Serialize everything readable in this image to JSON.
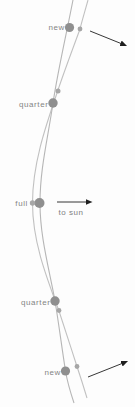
{
  "diagram": {
    "colors": {
      "background": "#fdfdfd",
      "earth_path_stroke": "#b6b6b6",
      "moon_path_stroke": "#c1c1c1",
      "earth_body_fill": "#8f8f8f",
      "moon_body_fill": "#a6a6a6",
      "arrow_stroke": "#1f1f1f",
      "label_text": "#848484"
    },
    "earth_path": "M 73 0 C 66 36 58 70 53 103 C 48 138 40 168 40 203 C 40 237 49 268 55 301 C 59 325 62 349 65.5 371 C 67.5 383 71 394 74 403",
    "moon_path": "M 88 0 C 85 11 82.5 19 80 29 C 72 51 64 72 57 93 C 45 128 32.5 165 32.5 203 C 32.5 241 46 276 59 311 C 65 329 71 348 77 366.5 C 80.5 377 84 388 87 398",
    "phase_labels": [
      {
        "id": "new-top",
        "text": "new",
        "x": 65,
        "y": 30,
        "anchor": "end"
      },
      {
        "id": "quarter-top",
        "text": "quarter",
        "x": 48.5,
        "y": 106.5,
        "anchor": "end"
      },
      {
        "id": "full",
        "text": "full",
        "x": 28,
        "y": 206,
        "anchor": "end"
      },
      {
        "id": "quarter-bottom",
        "text": "quarter",
        "x": 50.5,
        "y": 304.5,
        "anchor": "end"
      },
      {
        "id": "new-bottom",
        "text": "new",
        "x": 61,
        "y": 374.5,
        "anchor": "end"
      }
    ],
    "annotation": {
      "id": "to-sun",
      "text": "to sun",
      "x": 71,
      "y": 215,
      "anchor": "middle"
    },
    "earth_bodies": [
      {
        "phase": "new",
        "cx": 69.5,
        "cy": 27.5,
        "r": 4.6
      },
      {
        "phase": "quarter",
        "cx": 53,
        "cy": 103,
        "r": 4.7
      },
      {
        "phase": "full",
        "cx": 39.5,
        "cy": 203,
        "r": 5.0
      },
      {
        "phase": "quarter",
        "cx": 55,
        "cy": 301,
        "r": 4.7
      },
      {
        "phase": "new",
        "cx": 65.5,
        "cy": 371,
        "r": 4.6
      }
    ],
    "moon_bodies": [
      {
        "phase": "new",
        "cx": 80,
        "cy": 29,
        "r": 2.4
      },
      {
        "phase": "quarter",
        "cx": 58,
        "cy": 91,
        "r": 2.5
      },
      {
        "phase": "full",
        "cx": 32.5,
        "cy": 203,
        "r": 2.7
      },
      {
        "phase": "quarter",
        "cx": 59,
        "cy": 310.5,
        "r": 2.4
      },
      {
        "phase": "new",
        "cx": 77,
        "cy": 366.5,
        "r": 2.4
      }
    ],
    "sun_arrows": [
      {
        "id": "sun-direction-top",
        "x1": 90,
        "y1": 31,
        "x2": 121,
        "y2": 43.5
      },
      {
        "id": "sun-direction-middle",
        "x1": 57,
        "y1": 202,
        "x2": 86,
        "y2": 202
      },
      {
        "id": "sun-direction-bottom",
        "x1": 88,
        "y1": 377,
        "x2": 122,
        "y2": 363.5
      }
    ]
  }
}
